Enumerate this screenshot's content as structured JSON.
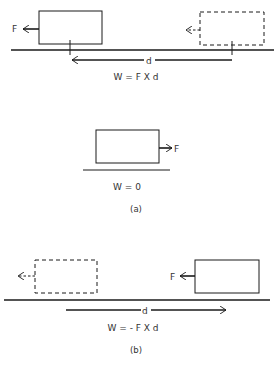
{
  "figure": {
    "colors": {
      "ink": "#1a1a1a",
      "text": "#333333",
      "background": "#ffffff"
    },
    "panel_top": {
      "force_label_solid": "F",
      "distance_label": "d",
      "equation": "W = F X d",
      "description": "Block moves left by distance d; force F points left (same direction as displacement)"
    },
    "panel_a": {
      "force_label": "F",
      "equation": "W = 0",
      "caption": "(a)",
      "description": "Block at rest with force F to the right; no displacement"
    },
    "panel_b": {
      "force_label_solid": "F",
      "distance_label": "d",
      "equation": "W = - F X d",
      "caption": "(b)",
      "description": "Block moves right by distance d; force F points left (opposite to displacement)"
    }
  }
}
